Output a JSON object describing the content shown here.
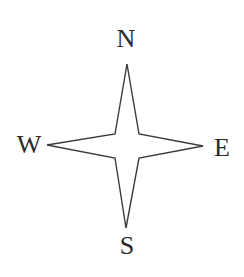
{
  "diagram": {
    "type": "compass-rose",
    "labels": {
      "north": "N",
      "east": "E",
      "south": "S",
      "west": "W"
    },
    "colors": {
      "stroke": "#3a3a3a",
      "fill": "#ffffff",
      "text": "#2a2a2a",
      "background": "#ffffff"
    }
  }
}
